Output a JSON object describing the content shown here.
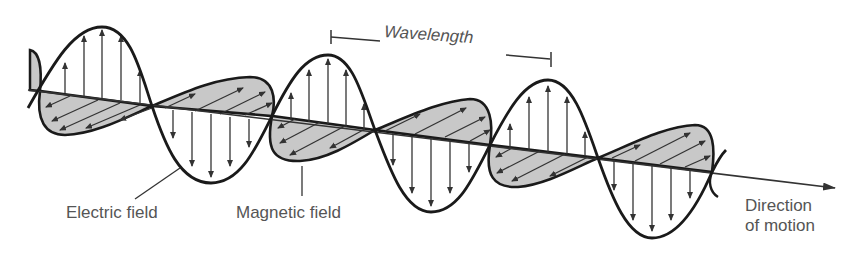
{
  "labels": {
    "electric_field": "Electric field",
    "magnetic_field": "Magnetic field",
    "wavelength": "Wavelength",
    "direction_line1": "Direction",
    "direction_line2": "of motion"
  },
  "colors": {
    "stroke": "#1a1a1a",
    "arrow": "#333333",
    "lobe_fill": "#c8c8c8",
    "text": "#555555",
    "background": "#ffffff"
  },
  "geometry": {
    "axis_start": [
      28,
      90
    ],
    "axis_end": [
      835,
      188
    ],
    "zero_crossings_x": [
      40,
      152,
      272,
      375,
      490,
      598,
      712
    ],
    "electric_peaks": [
      [
        100,
        27
      ],
      [
        210,
        183
      ],
      [
        330,
        55
      ],
      [
        430,
        212
      ],
      [
        550,
        80
      ],
      [
        655,
        238
      ]
    ],
    "wavelength_bar": {
      "x1": 330,
      "y1": 37,
      "x2": 552,
      "y2": 58
    }
  }
}
